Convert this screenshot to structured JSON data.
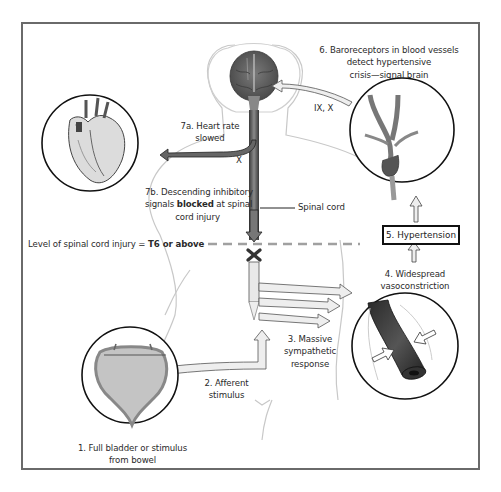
{
  "diagram": {
    "labels": {
      "step1": [
        "1. Full bladder or stimulus",
        "from bowel"
      ],
      "step2": [
        "2. Afferent",
        "stimulus"
      ],
      "step3": [
        "3. Massive",
        "sympathetic",
        "response"
      ],
      "step4": [
        "4. Widespread",
        "vasoconstriction"
      ],
      "step5": "5. Hypertension",
      "step6": [
        "6. Baroreceptors in blood vessels",
        "detect hypertensive",
        "crisis—signal brain"
      ],
      "step7a": [
        "7a. Heart rate",
        "slowed"
      ],
      "step7b_line1": "7b. Descending inhibitory",
      "step7b_line2_pre": "signals ",
      "step7b_line2_bold": "blocked",
      "step7b_line2_post": " at spinal",
      "step7b_line3": "cord injury",
      "spinal_cord": "Spinal cord",
      "injury_level_pre": "Level of spinal cord injury = ",
      "injury_level_bold": "T6 or above",
      "nerve_ix_x": "IX, X",
      "nerve_x": "X"
    },
    "icons": {
      "heart": "heart-illustration",
      "brain": "brain-illustration",
      "carotid": "carotid-baroreceptor-illustration",
      "bladder": "bladder-illustration",
      "vessel": "constricted-vessel-illustration",
      "block": "x-block-icon"
    },
    "colors": {
      "frame": "#6a6a6a",
      "brain": "#5a5a5a",
      "cord_dark": "#4a4a4a",
      "arrow_fill": "#e8e8e8",
      "dashed_line": "#9a9a9a",
      "bladder": "#c8c8c8"
    }
  }
}
